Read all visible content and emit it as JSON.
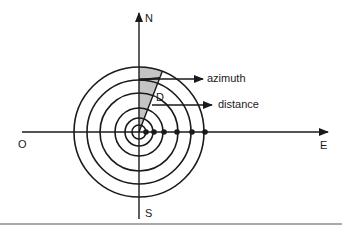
{
  "diagram": {
    "type": "polar-coordinate-diagram",
    "center": {
      "x": 139,
      "y": 132
    },
    "ring_radii": [
      7,
      14,
      24,
      39,
      52,
      65
    ],
    "distance_markers_x": [
      146,
      154,
      164,
      177,
      192,
      205
    ],
    "sector": {
      "from_deg": 0,
      "to_deg": 21,
      "fill": "#c4c4c4"
    },
    "stroke_color": "#1a1a1a",
    "axes": {
      "north": "N",
      "south": "S",
      "east": "E",
      "origin": "O"
    },
    "labels": {
      "azimuth": "azimuth",
      "distance": "distance",
      "d_marker": "D"
    }
  }
}
